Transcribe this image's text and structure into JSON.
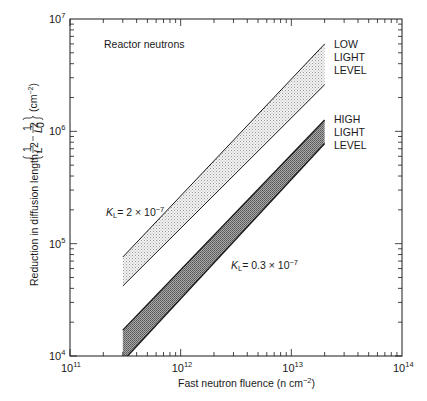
{
  "chart_data": {
    "type": "area",
    "title": "",
    "xlabel": "Fast neutron fluence (n cm^-2)",
    "ylabel": "Reduction in diffusion length, {1/L^2 - 1/L0^2} (cm^-2)",
    "xscale": "log",
    "yscale": "log",
    "xlim": [
      100000000000.0,
      100000000000000.0
    ],
    "ylim": [
      10000.0,
      10000000.0
    ],
    "x_tick_labels": [
      "10^11",
      "10^12",
      "10^13",
      "10^14"
    ],
    "y_tick_labels": [
      "10^4",
      "10^5",
      "10^6",
      "10^7"
    ],
    "grid": false,
    "annotations": [
      {
        "text": "Reactor neutrons",
        "position": "upper-left"
      },
      {
        "text": "K_L = 2 × 10^-7",
        "refers_to": "LOW LIGHT LEVEL"
      },
      {
        "text": "K_L = 0.3 × 10^-7",
        "refers_to": "HIGH LIGHT LEVEL"
      }
    ],
    "series": [
      {
        "name": "LOW LIGHT LEVEL",
        "kl": "2 × 10^-7",
        "fill": "light stipple",
        "x": [
          300000000000.0,
          20000000000000.0
        ],
        "upper": [
          76000.0,
          6000000.0
        ],
        "lower": [
          42000.0,
          2600000.0
        ]
      },
      {
        "name": "HIGH LIGHT LEVEL",
        "kl": "0.3 × 10^-7",
        "fill": "dark stipple",
        "x": [
          300000000000.0,
          20000000000000.0
        ],
        "upper": [
          17000.0,
          1260000.0
        ],
        "lower": [
          9000.0,
          780000.0
        ]
      }
    ]
  },
  "labels": {
    "reactor": "Reactor neutrons",
    "low": [
      "LOW",
      "LIGHT",
      "LEVEL"
    ],
    "high": [
      "HIGH",
      "LIGHT",
      "LEVEL"
    ],
    "kl_low_prefix": "K",
    "kl_low_sub": "L",
    "kl_low_value": "= 2 × 10",
    "kl_low_exp": "−7",
    "kl_high_prefix": "K",
    "kl_high_sub": "L",
    "kl_high_value": "= 0.3 × 10",
    "kl_high_exp": "−7",
    "xlabel_main": "Fast neutron fluence (n cm",
    "xlabel_exp": "−2",
    "xlabel_end": ")",
    "ylabel_main": "Reduction in diffusion length,",
    "ylabel_unit": "(cm",
    "ylabel_unit_exp": "−2",
    "ylabel_unit_end": ")",
    "tick_base": "10",
    "x_tick_exps": [
      "11",
      "12",
      "13",
      "14"
    ],
    "y_tick_exps": [
      "4",
      "5",
      "6",
      "7"
    ]
  },
  "colors": {
    "axis": "#1a1a1a",
    "low_fill": "#d9d9d9",
    "high_fill": "#8c8c8c",
    "band_edge": "#1a1a1a"
  }
}
